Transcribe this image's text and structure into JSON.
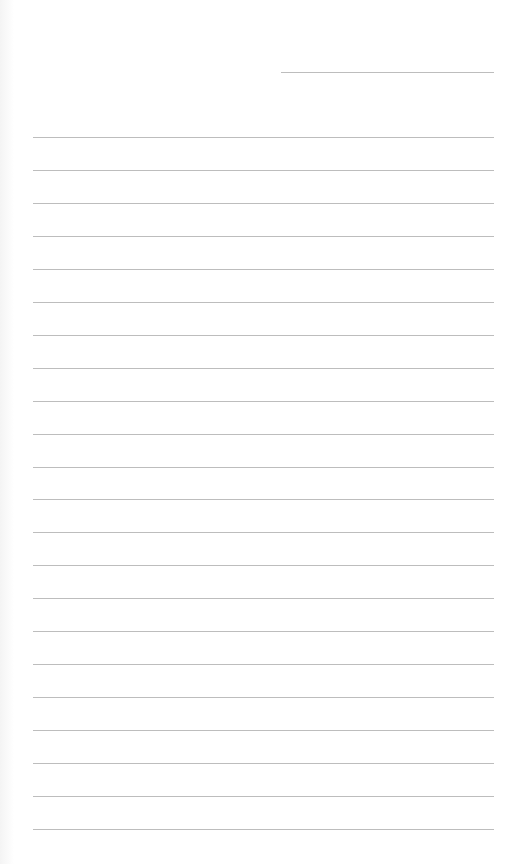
{
  "page": {
    "type": "lined-paper",
    "header_line": {
      "label": ""
    },
    "line_count": 22,
    "lines_text": [
      "",
      "",
      "",
      "",
      "",
      "",
      "",
      "",
      "",
      "",
      "",
      "",
      "",
      "",
      "",
      "",
      "",
      "",
      "",
      "",
      "",
      ""
    ],
    "colors": {
      "paper": "#ffffff",
      "rule": "#bdbdbd"
    }
  }
}
